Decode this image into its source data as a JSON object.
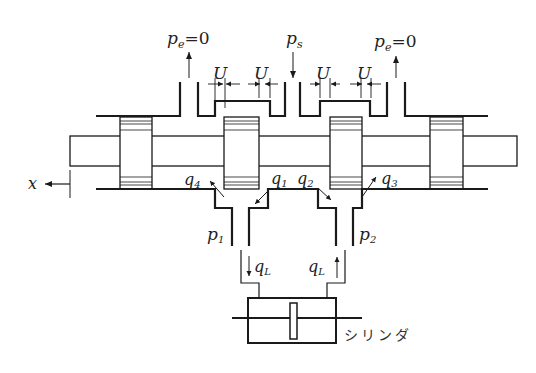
{
  "diagram": {
    "type": "spool valve schematic (4-land, 4-way servo valve with cylinder)",
    "labels": {
      "exhaust_left": {
        "symbol": "p",
        "sub": "e",
        "rest": "=0"
      },
      "supply": {
        "symbol": "p",
        "sub": "s"
      },
      "exhaust_right": {
        "symbol": "p",
        "sub": "e",
        "rest": "=0"
      },
      "underlap": [
        "U",
        "U",
        "U",
        "U"
      ],
      "axis": "x",
      "flows": [
        {
          "symbol": "q",
          "sub": "4"
        },
        {
          "symbol": "q",
          "sub": "1"
        },
        {
          "symbol": "q",
          "sub": "2"
        },
        {
          "symbol": "q",
          "sub": "3"
        }
      ],
      "port_pressures": [
        {
          "symbol": "p",
          "sub": "1"
        },
        {
          "symbol": "p",
          "sub": "2"
        }
      ],
      "load_flows": [
        {
          "symbol": "q",
          "sub": "L"
        },
        {
          "symbol": "q",
          "sub": "L"
        }
      ],
      "cylinder": "シリンダ"
    },
    "colors": {
      "line": "#1a1a1a",
      "background": "#ffffff"
    }
  }
}
